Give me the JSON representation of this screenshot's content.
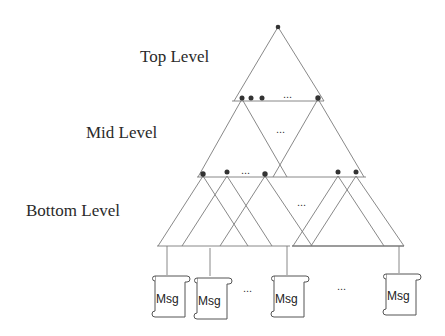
{
  "levels": {
    "top": "Top Level",
    "mid": "Mid Level",
    "bottom": "Bottom Level"
  },
  "ellipsis": "...",
  "messages": [
    "Msg",
    "Msg",
    "Msg",
    "Msg"
  ],
  "colors": {
    "line": "#7a7a7a",
    "node": "#333333",
    "text": "#2a2a2a"
  }
}
